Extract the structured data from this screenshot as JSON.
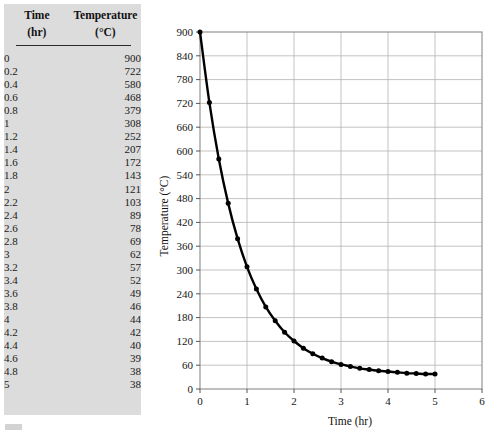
{
  "table": {
    "headers": {
      "time": "Time",
      "time_unit": "(hr)",
      "temperature": "Temperature",
      "temperature_unit": "(°C)"
    },
    "rows": [
      {
        "time": "0",
        "temp": "900"
      },
      {
        "time": "0.2",
        "temp": "722"
      },
      {
        "time": "0.4",
        "temp": "580"
      },
      {
        "time": "0.6",
        "temp": "468"
      },
      {
        "time": "0.8",
        "temp": "379"
      },
      {
        "time": "1",
        "temp": "308"
      },
      {
        "time": "1.2",
        "temp": "252"
      },
      {
        "time": "1.4",
        "temp": "207"
      },
      {
        "time": "1.6",
        "temp": "172"
      },
      {
        "time": "1.8",
        "temp": "143"
      },
      {
        "time": "2",
        "temp": "121"
      },
      {
        "time": "2.2",
        "temp": "103"
      },
      {
        "time": "2.4",
        "temp": "89"
      },
      {
        "time": "2.6",
        "temp": "78"
      },
      {
        "time": "2.8",
        "temp": "69"
      },
      {
        "time": "3",
        "temp": "62"
      },
      {
        "time": "3.2",
        "temp": "57"
      },
      {
        "time": "3.4",
        "temp": "52"
      },
      {
        "time": "3.6",
        "temp": "49"
      },
      {
        "time": "3.8",
        "temp": "46"
      },
      {
        "time": "4",
        "temp": "44"
      },
      {
        "time": "4.2",
        "temp": "42"
      },
      {
        "time": "4.4",
        "temp": "40"
      },
      {
        "time": "4.6",
        "temp": "39"
      },
      {
        "time": "4.8",
        "temp": "38"
      },
      {
        "time": "5",
        "temp": "38"
      }
    ]
  },
  "chart_data": {
    "type": "line",
    "title": "",
    "xlabel": "Time (hr)",
    "ylabel": "Temperature (°C)",
    "xlim": [
      0,
      6
    ],
    "ylim": [
      0,
      900
    ],
    "xticks": [
      0,
      1,
      2,
      3,
      4,
      5,
      6
    ],
    "yticks": [
      0,
      60,
      120,
      180,
      240,
      300,
      360,
      420,
      480,
      540,
      600,
      660,
      720,
      780,
      840,
      900
    ],
    "grid": true,
    "legend": "none",
    "marker": "filled-circle",
    "line_color": "#000000",
    "grid_color": "#b4b4b4",
    "x": [
      0,
      0.2,
      0.4,
      0.6,
      0.8,
      1,
      1.2,
      1.4,
      1.6,
      1.8,
      2,
      2.2,
      2.4,
      2.6,
      2.8,
      3,
      3.2,
      3.4,
      3.6,
      3.8,
      4,
      4.2,
      4.4,
      4.6,
      4.8,
      5
    ],
    "y": [
      900,
      722,
      580,
      468,
      379,
      308,
      252,
      207,
      172,
      143,
      121,
      103,
      89,
      78,
      69,
      62,
      57,
      52,
      49,
      46,
      44,
      42,
      40,
      39,
      38,
      38
    ]
  }
}
